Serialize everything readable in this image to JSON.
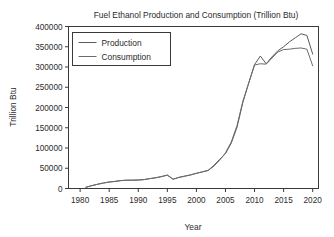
{
  "chart_data": {
    "type": "line",
    "title": "Fuel Ethanol Production and Consumption (Trillion Btu)",
    "xlabel": "Year",
    "ylabel": "Trillion Btu",
    "xlim": [
      1978,
      2021
    ],
    "ylim": [
      0,
      400000
    ],
    "xticks": [
      1980,
      1985,
      1990,
      1995,
      2000,
      2005,
      2010,
      2015,
      2020
    ],
    "yticks": [
      0,
      50000,
      100000,
      150000,
      200000,
      250000,
      300000,
      350000,
      400000
    ],
    "xtick_labels": [
      "1980",
      "1985",
      "1990",
      "1995",
      "2000",
      "2005",
      "2010",
      "2015",
      "2020"
    ],
    "ytick_labels": [
      "0",
      "50000",
      "100000",
      "150000",
      "200000",
      "250000",
      "300000",
      "350000",
      "400000"
    ],
    "grid": false,
    "legend_position": "upper left",
    "legend_entries": [
      "Production",
      "Consumption"
    ],
    "x": [
      1981,
      1982,
      1983,
      1984,
      1985,
      1986,
      1987,
      1988,
      1989,
      1990,
      1991,
      1992,
      1993,
      1994,
      1995,
      1996,
      1997,
      1998,
      1999,
      2000,
      2001,
      2002,
      2003,
      2004,
      2005,
      2006,
      2007,
      2008,
      2009,
      2010,
      2011,
      2012,
      2013,
      2014,
      2015,
      2016,
      2017,
      2018,
      2019,
      2020
    ],
    "series": [
      {
        "name": "Production",
        "color": "#5a5a5a",
        "values": [
          3000,
          7000,
          10500,
          13500,
          16000,
          17500,
          19500,
          20500,
          20500,
          21000,
          22000,
          24500,
          26500,
          29500,
          33000,
          23000,
          27500,
          30500,
          33500,
          37500,
          41000,
          44500,
          57000,
          72000,
          86000,
          112000,
          152000,
          213000,
          261000,
          306000,
          327000,
          308000,
          325000,
          340000,
          350000,
          362000,
          372000,
          382000,
          378000,
          332000
        ]
      },
      {
        "name": "Consumption",
        "color": "#6b6b6b",
        "values": [
          3000,
          7000,
          10500,
          13500,
          16000,
          17500,
          19500,
          20500,
          20500,
          21000,
          22000,
          24500,
          26500,
          29500,
          33000,
          23000,
          27500,
          30500,
          33500,
          37500,
          41000,
          44500,
          55000,
          70000,
          88000,
          115000,
          156000,
          216000,
          260000,
          305000,
          308000,
          307000,
          322000,
          337000,
          343000,
          344000,
          346000,
          347000,
          344000,
          303000
        ]
      }
    ]
  },
  "accessibility": {
    "figure_role": "line-chart"
  }
}
